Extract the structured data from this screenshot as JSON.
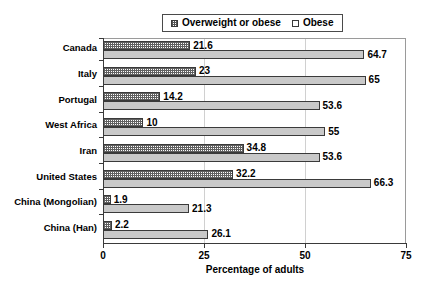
{
  "chart_data": {
    "type": "bar",
    "orientation": "horizontal",
    "title": "",
    "xlabel": "Percentage of adults",
    "ylabel": "",
    "xlim": [
      0,
      75
    ],
    "xticks": [
      0,
      25,
      50,
      75
    ],
    "grid": true,
    "legend_position": "top-center",
    "categories": [
      "Canada",
      "Italy",
      "Portugal",
      "West Africa",
      "Iran",
      "United States",
      "China (Mongolian)",
      "China (Han)"
    ],
    "series": [
      {
        "name": "Obese",
        "style": "dotted-white",
        "values": [
          21.6,
          23,
          14.2,
          10,
          34.8,
          32.2,
          1.9,
          2.2
        ],
        "labels": [
          "21.6",
          "23",
          "14.2",
          "10",
          "34.8",
          "32.2",
          "1.9",
          "2.2"
        ]
      },
      {
        "name": "Overweight or obese",
        "style": "gray",
        "values": [
          64.7,
          65,
          53.6,
          55,
          53.6,
          66.3,
          21.3,
          26.1
        ],
        "labels": [
          "64.7",
          "65",
          "53.6",
          "55",
          "53.6",
          "66.3",
          "21.3",
          "26.1"
        ]
      }
    ]
  },
  "legend": {
    "entries": [
      {
        "label": "Overweight or obese",
        "swatch": "dotted-swatch"
      },
      {
        "label": "Obese",
        "swatch": "plain-swatch"
      }
    ]
  },
  "axis": {
    "x_title": "Percentage of adults",
    "x_tick_labels": [
      "0",
      "25",
      "50",
      "75"
    ]
  },
  "colors": {
    "overweight_fill": "#c9c9c9",
    "obese_fill": "#ffffff",
    "bar_border": "#3a3a3a",
    "grid": "#d0d0d0",
    "axis": "#3a3a3a",
    "background": "#ffffff"
  }
}
